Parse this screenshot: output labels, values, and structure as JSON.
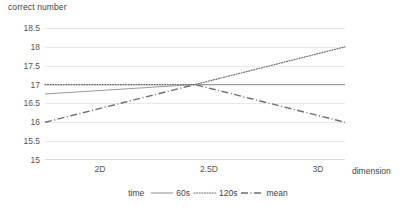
{
  "chart_data": {
    "type": "line",
    "title": "",
    "ylabel": "correct number",
    "xlabel": "dimension",
    "categories": [
      "2D",
      "2.5D",
      "3D"
    ],
    "yticks": [
      "18.5",
      "18",
      "17.5",
      "17",
      "16.5",
      "16",
      "15.5",
      "15"
    ],
    "ylim": [
      15,
      18.5
    ],
    "ytick_step": 0.5,
    "grid": true,
    "legend_position": "bottom",
    "legend_title": "time",
    "series": [
      {
        "name": "60s",
        "style": "solid",
        "color": "#9a9a9a",
        "values": [
          16.75,
          17.0,
          17.0
        ]
      },
      {
        "name": "120s",
        "style": "dotted",
        "color": "#6e6e6e",
        "values": [
          17.0,
          17.0,
          18.0
        ]
      },
      {
        "name": "mean",
        "style": "dash-dot",
        "color": "#6e6e6e",
        "values": [
          16.0,
          17.0,
          16.0
        ]
      }
    ]
  },
  "axis": {
    "y_title": "correct number",
    "x_title": "dimension",
    "y_ticks": [
      {
        "label": "18.5",
        "value": 18.5
      },
      {
        "label": "18",
        "value": 18
      },
      {
        "label": "17.5",
        "value": 17.5
      },
      {
        "label": "17",
        "value": 17
      },
      {
        "label": "16.5",
        "value": 16.5
      },
      {
        "label": "16",
        "value": 16
      },
      {
        "label": "15.5",
        "value": 15.5
      },
      {
        "label": "15",
        "value": 15
      }
    ],
    "x_ticks": [
      {
        "label": "2D"
      },
      {
        "label": "2.5D"
      },
      {
        "label": "3D"
      }
    ]
  },
  "legend": {
    "title": "time",
    "items": [
      {
        "label": "60s"
      },
      {
        "label": "120s"
      },
      {
        "label": "mean"
      }
    ]
  }
}
